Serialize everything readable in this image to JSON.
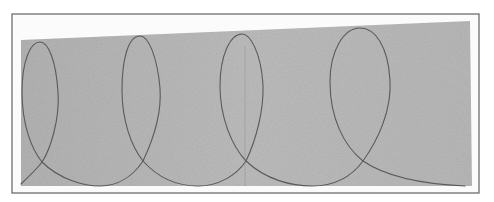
{
  "artwork": {
    "subject": "pencil drawing of continuous looping line on gray paper",
    "frame_color": "#6e6e6e",
    "mat_color": "#fbfbfb",
    "paper_color": "#b9b9b9",
    "line_color": "#5a5a5a",
    "loop_count": 4
  }
}
